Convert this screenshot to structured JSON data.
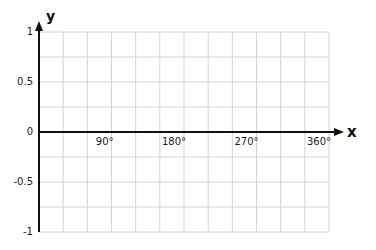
{
  "chart_data": {
    "type": "line",
    "title": "",
    "xlabel": "x",
    "ylabel": "y",
    "xlim": [
      0,
      360
    ],
    "ylim": [
      -1,
      1
    ],
    "grid": true,
    "grid_columns": 12,
    "grid_rows": 8,
    "x_ticks": [
      {
        "value": 90,
        "label": "90°"
      },
      {
        "value": 180,
        "label": "180°"
      },
      {
        "value": 270,
        "label": "270°"
      },
      {
        "value": 360,
        "label": "360°"
      }
    ],
    "y_ticks": [
      {
        "value": 1,
        "label": "1"
      },
      {
        "value": 0.5,
        "label": "0.5"
      },
      {
        "value": 0,
        "label": "0"
      },
      {
        "value": -0.5,
        "label": "-0.5"
      },
      {
        "value": -1,
        "label": "-1"
      }
    ],
    "series": [],
    "legend": null
  },
  "colors": {
    "grid": "#d4d4d4",
    "axis": "#111111",
    "text": "#1a1a1a"
  }
}
